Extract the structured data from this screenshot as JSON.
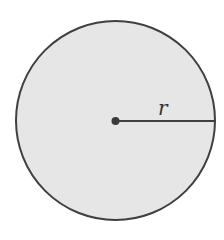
{
  "diagram": {
    "shape": "circle",
    "center": {
      "x": 115.5,
      "y": 120.5
    },
    "radius_px": 99.5,
    "radius_label": "r",
    "colors": {
      "fill": "#e6e6e6",
      "stroke": "#3f3f3f",
      "center_dot": "#3a3a3a",
      "radius_line": "#3f3f3f",
      "label": "#333333"
    }
  }
}
